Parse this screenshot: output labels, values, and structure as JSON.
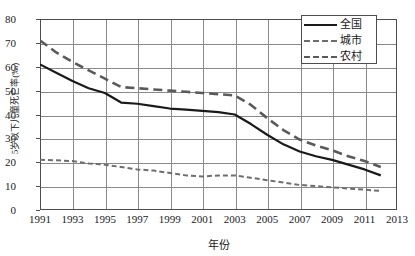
{
  "chart_data": {
    "type": "line",
    "title": "",
    "xlabel": "年份",
    "ylabel": "5岁以下儿童死亡率(‰)",
    "xlim": [
      1991,
      2013
    ],
    "ylim": [
      0,
      80
    ],
    "xticks": [
      "1991",
      "1993",
      "1995",
      "1997",
      "1999",
      "2001",
      "2003",
      "2005",
      "2007",
      "2009",
      "2011",
      "2013"
    ],
    "yticks": [
      "0",
      "10",
      "20",
      "30",
      "40",
      "50",
      "60",
      "70",
      "80"
    ],
    "grid": true,
    "legend_position": "top-right",
    "x": [
      1991,
      1992,
      1993,
      1994,
      1995,
      1996,
      1997,
      1998,
      1999,
      2000,
      2001,
      2002,
      2003,
      2004,
      2005,
      2006,
      2007,
      2008,
      2009,
      2010,
      2011,
      2012
    ],
    "series": [
      {
        "name": "全国",
        "style": "solid",
        "color": "#1a1a1a",
        "values": [
          61.0,
          57.5,
          54.0,
          51.0,
          49.0,
          45.0,
          44.5,
          43.5,
          42.5,
          42.0,
          41.5,
          41.0,
          40.0,
          36.0,
          31.5,
          27.5,
          24.5,
          22.5,
          21.0,
          19.0,
          17.0,
          14.5
        ]
      },
      {
        "name": "城市",
        "style": "dotted",
        "color": "#6e6e6e",
        "values": [
          21.0,
          20.8,
          20.5,
          19.5,
          19.0,
          18.0,
          17.0,
          16.5,
          15.5,
          14.5,
          14.0,
          14.5,
          14.5,
          13.5,
          12.5,
          11.5,
          10.5,
          10.0,
          9.5,
          9.0,
          8.5,
          8.0
        ]
      },
      {
        "name": "农村",
        "style": "dashed",
        "color": "#5a5a5a",
        "values": [
          71.0,
          66.0,
          62.0,
          58.5,
          55.0,
          51.5,
          51.0,
          50.5,
          50.0,
          49.5,
          49.0,
          48.5,
          48.0,
          44.0,
          38.5,
          33.5,
          29.5,
          27.0,
          25.0,
          22.5,
          20.5,
          18.0
        ]
      }
    ]
  },
  "legend": {
    "items": [
      {
        "label": "全国"
      },
      {
        "label": "城市"
      },
      {
        "label": "农村"
      }
    ]
  }
}
